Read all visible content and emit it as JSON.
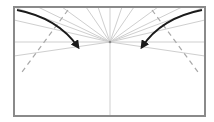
{
  "diagram": {
    "type": "origami-fold-instruction",
    "colors": {
      "background": "#ffffff",
      "frame": "#8a8a8a",
      "crease": "#cfcfcf",
      "dashed_fold": "#a8a8a8",
      "arrow": "#1a1a1a",
      "center_point": "#888888"
    },
    "frame": {
      "x": 14,
      "y": 7,
      "width": 191,
      "height": 109
    },
    "center_point": {
      "x": 110,
      "y": 42
    },
    "horizontal_crease_y": 42,
    "vertical_crease_x": 110,
    "fan_targets": [
      [
        14,
        7
      ],
      [
        38,
        7
      ],
      [
        62,
        7
      ],
      [
        86,
        7
      ],
      [
        98,
        7
      ],
      [
        122,
        7
      ],
      [
        134,
        7
      ],
      [
        158,
        7
      ],
      [
        182,
        7
      ],
      [
        205,
        7
      ],
      [
        14,
        20
      ],
      [
        205,
        20
      ],
      [
        14,
        56
      ],
      [
        205,
        56
      ]
    ],
    "dashed_folds": [
      {
        "x1": 68,
        "y1": 10,
        "x2": 22,
        "y2": 72
      },
      {
        "x1": 152,
        "y1": 10,
        "x2": 198,
        "y2": 72
      }
    ],
    "arrows": [
      {
        "name": "left-fold-arrow",
        "path": "M 17 10 Q 58 18 78 47"
      },
      {
        "name": "right-fold-arrow",
        "path": "M 202 10 Q 161 18 142 47"
      }
    ]
  }
}
